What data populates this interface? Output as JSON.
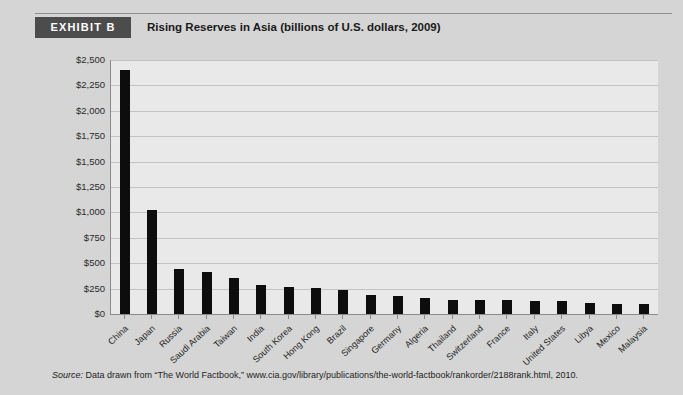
{
  "header": {
    "badge_label": "EXHIBIT B",
    "title": "Rising Reserves in Asia (billions of U.S. dollars, 2009)"
  },
  "source": {
    "label": "Source:",
    "text": " Data drawn from “The World Factbook,” www.cia.gov/library/publications/the-world-factbook/rankorder/2188rank.html, 2010."
  },
  "colors": {
    "page_background": "#d5d5d5",
    "badge_background": "#4c4c4c",
    "badge_text": "#ffffff",
    "plot_background": "#e9e9e9",
    "bar_color": "#0d0d0d",
    "gridline": "#c3c3c3",
    "axis_line": "#8a8a8a"
  },
  "chart_data": {
    "type": "bar",
    "title": "Rising Reserves in Asia (billions of U.S. dollars, 2009)",
    "xlabel": "",
    "ylabel": "",
    "ylim": [
      0,
      2500
    ],
    "ytick_step": 250,
    "ytick_labels": [
      "$2,500",
      "$2,250",
      "$2,000",
      "$1,750",
      "$1,500",
      "$1,250",
      "$1,000",
      "$750",
      "$500",
      "$250",
      "$0"
    ],
    "ytick_values": [
      2500,
      2250,
      2000,
      1750,
      1500,
      1250,
      1000,
      750,
      500,
      250,
      0
    ],
    "grid": true,
    "legend": false,
    "units": "billions of U.S. dollars",
    "year": 2009,
    "categories": [
      "China",
      "Japan",
      "Russia",
      "Saudi Arabia",
      "Taiwan",
      "India",
      "South Korea",
      "Hong Kong",
      "Brazil",
      "Singapore",
      "Germany",
      "Algeria",
      "Thailand",
      "Switzerland",
      "France",
      "Italy",
      "United States",
      "Libya",
      "Mexico",
      "Malaysia"
    ],
    "values": [
      2400,
      1020,
      440,
      410,
      350,
      285,
      270,
      255,
      240,
      190,
      180,
      155,
      140,
      135,
      135,
      130,
      125,
      105,
      100,
      95
    ]
  }
}
